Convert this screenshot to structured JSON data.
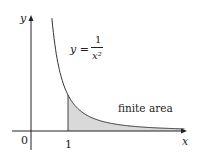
{
  "chart_data": {
    "type": "area",
    "title": "",
    "function": "y = 1/x^2",
    "xlabel": "x",
    "ylabel": "y",
    "x_ticks": [
      "0",
      "1"
    ],
    "shaded_region": {
      "from_x": 1,
      "to_x": "infinity",
      "label": "finite area"
    },
    "curve_label": {
      "lhs": "y =",
      "numerator": "1",
      "denominator": "x²"
    },
    "colors": {
      "curve": "#333333",
      "fill": "#d9d9d9",
      "axis": "#222222"
    }
  },
  "labels": {
    "y_axis": "y",
    "x_axis": "x",
    "origin": "0",
    "tick_one": "1",
    "area": "finite area",
    "eq_lhs": "y =",
    "eq_num": "1",
    "eq_den": "x²"
  }
}
